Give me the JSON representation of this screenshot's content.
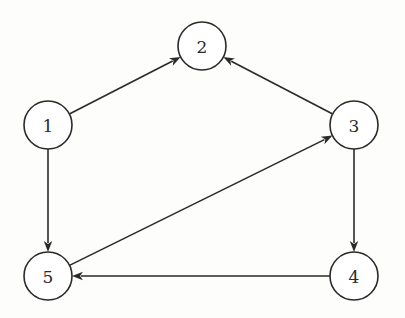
{
  "diagram": {
    "type": "directed-graph",
    "nodes": [
      {
        "id": "1",
        "label": "1"
      },
      {
        "id": "2",
        "label": "2"
      },
      {
        "id": "3",
        "label": "3"
      },
      {
        "id": "4",
        "label": "4"
      },
      {
        "id": "5",
        "label": "5"
      }
    ],
    "edges": [
      {
        "from": "1",
        "to": "2"
      },
      {
        "from": "3",
        "to": "2"
      },
      {
        "from": "1",
        "to": "5"
      },
      {
        "from": "5",
        "to": "3"
      },
      {
        "from": "3",
        "to": "4"
      },
      {
        "from": "4",
        "to": "5"
      }
    ],
    "colors": {
      "stroke": "#2a2a2a",
      "node_fill": "#ffffff",
      "background": "#fdfdfc"
    }
  }
}
